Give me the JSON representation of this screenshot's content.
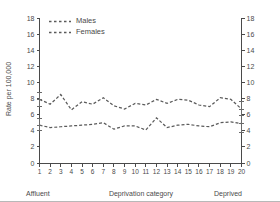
{
  "chart_data": {
    "type": "line",
    "title": "",
    "xlabel": "Deprivation category",
    "ylabel": "Rate per 100,000",
    "xlim": [
      1,
      20
    ],
    "ylim": [
      0,
      18
    ],
    "ytick_step": 2,
    "yticks": [
      "0",
      "2",
      "4",
      "6",
      "8",
      "10",
      "12",
      "14",
      "16",
      "18"
    ],
    "xticks": [
      "1",
      "2",
      "3",
      "4",
      "5",
      "6",
      "7",
      "8",
      "9",
      "10",
      "11",
      "12",
      "13",
      "14",
      "15",
      "16",
      "17",
      "18",
      "19",
      "20"
    ],
    "grid": false,
    "dual_y_axis": true,
    "right_axis_labels": [
      "0",
      "2",
      "4",
      "6",
      "8",
      "10",
      "12",
      "14",
      "16",
      "18"
    ],
    "legend_position": "top-left",
    "categories": [
      1,
      2,
      3,
      4,
      5,
      6,
      7,
      8,
      9,
      10,
      11,
      12,
      13,
      14,
      15,
      16,
      17,
      18,
      19,
      20
    ],
    "series": [
      {
        "name": "Males",
        "line_style": "dashed",
        "values": [
          7.9,
          7.3,
          8.5,
          6.6,
          7.6,
          7.3,
          8.1,
          7.1,
          6.7,
          7.4,
          7.2,
          7.9,
          7.4,
          7.9,
          7.8,
          7.2,
          7.0,
          8.1,
          7.9,
          6.7
        ],
        "error_bars": [
          {
            "category": 1,
            "value": 7.9,
            "low": 7.0,
            "high": 8.8
          },
          {
            "category": 20,
            "value": 6.7,
            "low": 5.9,
            "high": 7.6
          }
        ]
      },
      {
        "name": "Females",
        "line_style": "dashed",
        "values": [
          4.7,
          4.4,
          4.5,
          4.6,
          4.7,
          4.8,
          5.0,
          4.2,
          4.6,
          4.6,
          4.1,
          5.6,
          4.4,
          4.7,
          4.8,
          4.6,
          4.5,
          5.0,
          5.1,
          4.9
        ],
        "error_bars": [
          {
            "category": 1,
            "value": 4.7,
            "low": 4.0,
            "high": 5.5
          },
          {
            "category": 20,
            "value": 4.9,
            "low": 3.8,
            "high": 5.9
          }
        ]
      }
    ],
    "annotations": {
      "left_anchor": "Affluent",
      "right_anchor": "Deprived"
    }
  },
  "legend": {
    "items": [
      {
        "label": "Males"
      },
      {
        "label": "Females"
      }
    ]
  },
  "colors": {
    "series_line": "#5a5a5a",
    "axis": "#4a4a4a",
    "text": "#4a4a4a",
    "background": "#ffffff"
  }
}
